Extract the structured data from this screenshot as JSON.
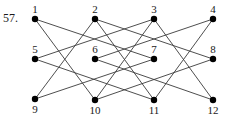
{
  "problem_number": "57.",
  "colors": {
    "edge": "#3a3a3a",
    "node": "#000000",
    "text": "#1a1a1a"
  },
  "graph": {
    "nodes": [
      {
        "id": "1",
        "label": "1",
        "x": 35,
        "y": 19,
        "label_pos": "above"
      },
      {
        "id": "2",
        "label": "2",
        "x": 95,
        "y": 19,
        "label_pos": "above"
      },
      {
        "id": "3",
        "label": "3",
        "x": 154,
        "y": 19,
        "label_pos": "above"
      },
      {
        "id": "4",
        "label": "4",
        "x": 213,
        "y": 19,
        "label_pos": "above"
      },
      {
        "id": "5",
        "label": "5",
        "x": 35,
        "y": 59,
        "label_pos": "above"
      },
      {
        "id": "6",
        "label": "6",
        "x": 95,
        "y": 59,
        "label_pos": "above"
      },
      {
        "id": "7",
        "label": "7",
        "x": 154,
        "y": 59,
        "label_pos": "above"
      },
      {
        "id": "8",
        "label": "8",
        "x": 213,
        "y": 59,
        "label_pos": "above"
      },
      {
        "id": "9",
        "label": "9",
        "x": 35,
        "y": 99,
        "label_pos": "below"
      },
      {
        "id": "10",
        "label": "10",
        "x": 95,
        "y": 100,
        "label_pos": "below"
      },
      {
        "id": "11",
        "label": "11",
        "x": 154,
        "y": 100,
        "label_pos": "below"
      },
      {
        "id": "12",
        "label": "12",
        "x": 213,
        "y": 100,
        "label_pos": "below"
      }
    ],
    "edges": [
      [
        "1",
        "7"
      ],
      [
        "1",
        "10"
      ],
      [
        "2",
        "9"
      ],
      [
        "2",
        "8"
      ],
      [
        "2",
        "11"
      ],
      [
        "3",
        "5"
      ],
      [
        "3",
        "10"
      ],
      [
        "3",
        "12"
      ],
      [
        "4",
        "6"
      ],
      [
        "4",
        "11"
      ],
      [
        "5",
        "11"
      ],
      [
        "6",
        "12"
      ],
      [
        "9",
        "7"
      ],
      [
        "10",
        "8"
      ]
    ]
  }
}
